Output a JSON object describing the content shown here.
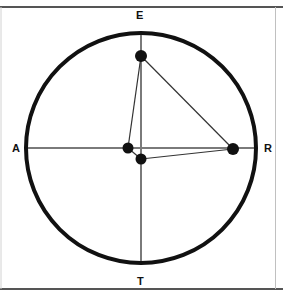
{
  "figure": {
    "background_color": "#ffffff",
    "frame": {
      "top_rule": {
        "y": 7,
        "color": "#555555",
        "thickness": 2
      },
      "bottom_rule": {
        "y": 289,
        "color": "#555555",
        "thickness": 2
      },
      "left_rule": {
        "x": 1,
        "color": "#cccccc",
        "thickness": 1
      },
      "right_rule": {
        "x": 275,
        "color": "#bbbbbb",
        "thickness": 1
      }
    },
    "circle": {
      "name": "main-circle",
      "center_x": 141,
      "center_y": 148,
      "radius": 115,
      "stroke_color": "#111111",
      "stroke_width": 4,
      "fill": "none"
    },
    "axes": [
      {
        "name": "horizontal-diameter",
        "from_label": "A",
        "to_label": "R",
        "x1": 26,
        "y1": 148,
        "x2": 256,
        "y2": 148,
        "stroke_color": "#7a7a7a",
        "stroke_width": 2
      },
      {
        "name": "vertical-diameter",
        "from_label": "E",
        "to_label": "T",
        "x1": 141,
        "y1": 33,
        "x2": 141,
        "y2": 263,
        "stroke_color": "#7a7a7a",
        "stroke_width": 2
      }
    ],
    "labels": [
      {
        "key": "E",
        "text": "E",
        "position": "top",
        "x": 136,
        "y": 10
      },
      {
        "key": "T",
        "text": "T",
        "position": "bottom",
        "x": 137,
        "y": 276
      },
      {
        "key": "A",
        "text": "A",
        "position": "left",
        "x": 12,
        "y": 143
      },
      {
        "key": "R",
        "text": "R",
        "position": "right",
        "x": 264,
        "y": 143
      }
    ],
    "points": [
      {
        "name": "point-upper",
        "x": 141,
        "y": 56,
        "radius": 6.0,
        "color": "#111111"
      },
      {
        "name": "point-center-left",
        "x": 128,
        "y": 148,
        "radius": 5.5,
        "color": "#111111"
      },
      {
        "name": "point-center-lower",
        "x": 141,
        "y": 159,
        "radius": 5.5,
        "color": "#111111"
      },
      {
        "name": "point-right",
        "x": 233,
        "y": 149,
        "radius": 6.0,
        "color": "#111111"
      }
    ],
    "segments": [
      {
        "name": "segment-upper-to-center-left",
        "x1": 141,
        "y1": 56,
        "x2": 128,
        "y2": 148,
        "stroke_color": "#333333",
        "stroke_width": 1.2
      },
      {
        "name": "segment-upper-to-right",
        "x1": 141,
        "y1": 56,
        "x2": 233,
        "y2": 149,
        "stroke_color": "#333333",
        "stroke_width": 1.2
      },
      {
        "name": "segment-center-left-to-lower",
        "x1": 128,
        "y1": 148,
        "x2": 141,
        "y2": 159,
        "stroke_color": "#333333",
        "stroke_width": 1.2
      },
      {
        "name": "segment-lower-to-right",
        "x1": 141,
        "y1": 159,
        "x2": 233,
        "y2": 149,
        "stroke_color": "#333333",
        "stroke_width": 1.2
      }
    ]
  }
}
